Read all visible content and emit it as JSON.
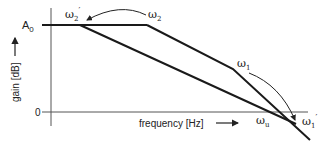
{
  "diagram": {
    "y_axis_label": "gain [dB]",
    "x_axis_label": "frequency [Hz]",
    "y_tick_top": "A",
    "y_tick_top_sub": "0",
    "y_tick_bottom": "0",
    "labels": {
      "omega2_prime": "ω",
      "omega2_prime_sub": "2",
      "omega2": "ω",
      "omega2_sub": "2",
      "omega1": "ω",
      "omega1_sub": "1",
      "omegau": "ω",
      "omegau_sub": "u",
      "omega1_prime": "ω",
      "omega1_prime_sub": "1"
    },
    "colors": {
      "line": "#1a1a1a",
      "axis": "#555555"
    }
  }
}
